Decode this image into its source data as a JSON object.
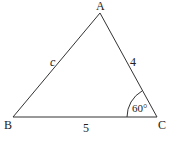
{
  "diagram": {
    "type": "triangle",
    "vertices": {
      "A": {
        "label": "A",
        "x": 100,
        "y": 13
      },
      "B": {
        "label": "B",
        "x": 13,
        "y": 117
      },
      "C": {
        "label": "C",
        "x": 157,
        "y": 117
      }
    },
    "sides": {
      "AB": {
        "label": "c"
      },
      "AC": {
        "label": "4"
      },
      "BC": {
        "label": "5"
      }
    },
    "angle_C": {
      "label": "60°"
    },
    "colors": {
      "line": "#333333",
      "text": "#222222",
      "background": "#ffffff"
    }
  }
}
